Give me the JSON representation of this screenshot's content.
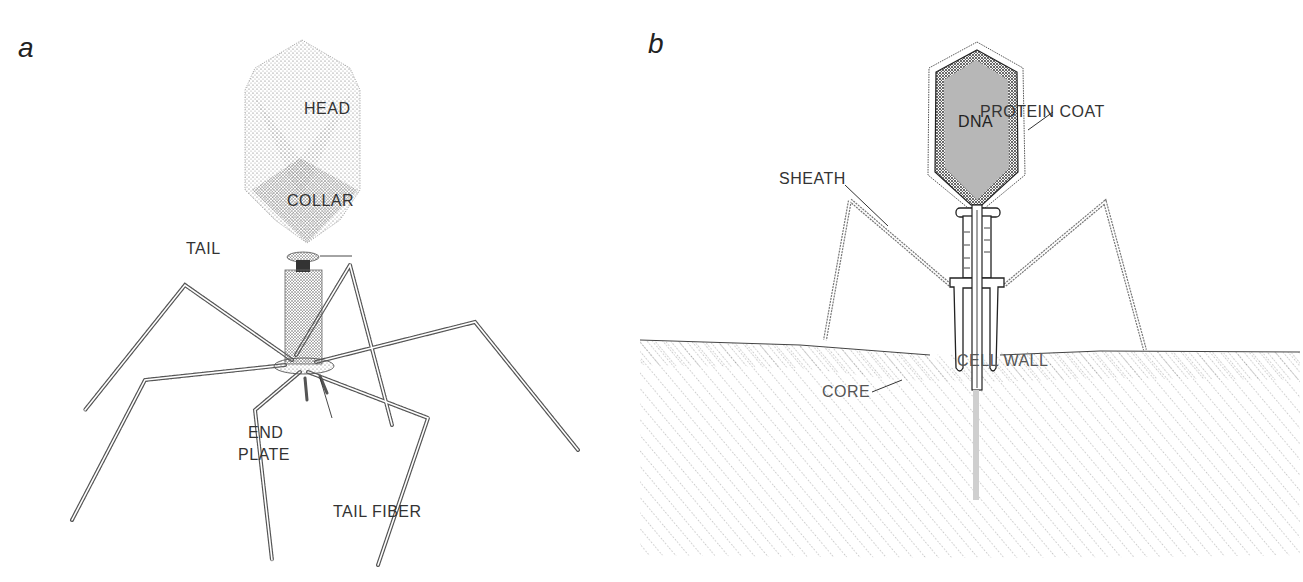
{
  "figure": {
    "panels": [
      {
        "id": "a",
        "letter": "a",
        "labels": {
          "head": "HEAD",
          "collar": "COLLAR",
          "tail": "TAIL",
          "end_plate_line1": "END",
          "end_plate_line2": "PLATE",
          "tail_fiber": "TAIL FIBER"
        }
      },
      {
        "id": "b",
        "letter": "b",
        "labels": {
          "dna": "DNA",
          "protein_coat": "PROTEIN COAT",
          "sheath": "SHEATH",
          "cell_wall": "CELL WALL",
          "core": "CORE"
        }
      }
    ],
    "colors": {
      "ink": "#333333",
      "dna_fill": "#b5b5b5",
      "core_fill": "#cfcfcf",
      "stipple": "#555555"
    }
  }
}
